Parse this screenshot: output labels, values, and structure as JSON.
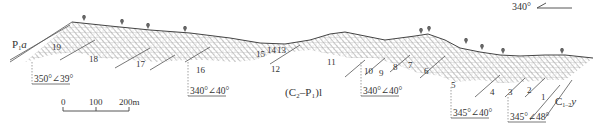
{
  "diagram": {
    "type": "geological-cross-section",
    "orientation": {
      "label": "340°",
      "icon": "direction-arrow-icon"
    },
    "formations": [
      {
        "id": "P1a",
        "main": "P",
        "sub": "1",
        "suffix": "a"
      },
      {
        "id": "C2-P1l",
        "text": "(C₂–P₁)l"
      },
      {
        "id": "C1-2y",
        "main": "C",
        "sub": "1–2",
        "suffix": "y"
      }
    ],
    "layers": [
      "19",
      "18",
      "17",
      "16",
      "15",
      "14",
      "13",
      "12",
      "11",
      "10",
      "9",
      "8",
      "7",
      "6",
      "5",
      "4",
      "3",
      "2",
      "1"
    ],
    "dip_measurements": [
      "350°∠39°",
      "340°∠40°",
      "340°∠40°",
      "345°∠40°",
      "345°∠48°"
    ],
    "scale_bar": {
      "ticks": [
        "0",
        "100",
        "200m"
      ]
    },
    "surface_symbol": "sample-point-icon",
    "colors": {
      "line": "#444444",
      "hatch": "#777777",
      "text": "#333333"
    }
  }
}
